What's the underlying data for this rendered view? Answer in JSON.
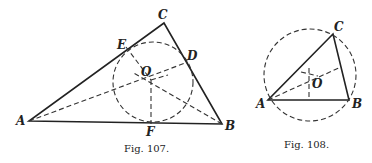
{
  "figures": [
    {
      "caption": "Fig. 107.",
      "labels": {
        "A": "A",
        "B": "B",
        "C": "C",
        "D": "D",
        "E": "E",
        "F": "F",
        "O": "O"
      },
      "description": "Triangle ABC with inscribed circle centered at O, tangent points D, E, F; dashed angle bisectors and radii"
    },
    {
      "caption": "Fig. 108.",
      "labels": {
        "A": "A",
        "B": "B",
        "C": "C",
        "O": "O"
      },
      "description": "Triangle ABC with circumscribed circle centered at O; dashed perpendicular bisectors"
    }
  ]
}
